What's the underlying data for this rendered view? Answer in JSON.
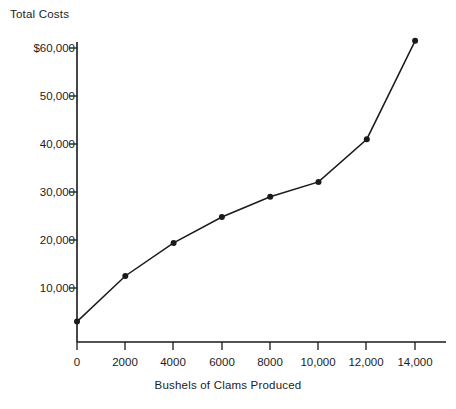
{
  "chart_data": {
    "type": "line",
    "title": "",
    "xlabel": "Bushels of Clams Produced",
    "ylabel": "Total Costs",
    "x": [
      0,
      2000,
      4000,
      6000,
      8000,
      10000,
      12000,
      14000
    ],
    "values": [
      3000,
      12500,
      19400,
      24800,
      29000,
      32100,
      41000,
      61500
    ],
    "series": [
      {
        "name": "Total Costs",
        "values": [
          3000,
          12500,
          19400,
          24800,
          29000,
          32100,
          41000,
          61500
        ]
      }
    ],
    "xtick_labels": [
      "0",
      "2000",
      "4000",
      "6000",
      "8000",
      "10,000",
      "12,000",
      "14,000"
    ],
    "xtick_values": [
      0,
      2000,
      4000,
      6000,
      8000,
      10000,
      12000,
      14000
    ],
    "ytick_labels": [
      "10,000",
      "20,000",
      "30,000",
      "40,000",
      "50,000",
      "$60,000"
    ],
    "ytick_values": [
      10000,
      20000,
      30000,
      40000,
      50000,
      60000
    ],
    "xlim": [
      0,
      14600
    ],
    "ylim": [
      0,
      63000
    ],
    "grid": false,
    "legend": false,
    "marker": "filled-circle",
    "line_color": "#1a1a1a",
    "marker_color": "#1a1a1a",
    "background_color": "#ffffff"
  },
  "axis": {
    "y_title": "Total Costs",
    "x_title": "Bushels of Clams Produced"
  }
}
